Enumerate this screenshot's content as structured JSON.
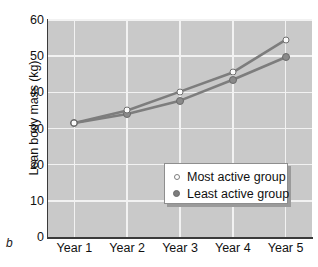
{
  "panel_label": "b",
  "chart_data": {
    "type": "line",
    "title": "",
    "xlabel": "",
    "ylabel": "Lean body mass (kg)",
    "categories": [
      "Year 1",
      "Year 2",
      "Year 3",
      "Year 4",
      "Year 5"
    ],
    "ylim": [
      0,
      60
    ],
    "yticks": [
      0,
      10,
      20,
      30,
      40,
      50,
      60
    ],
    "ytick_labels": [
      "0",
      "10",
      "20",
      "30",
      "40",
      "50",
      "60"
    ],
    "grid": true,
    "legend_position": "center-lower-inside",
    "series": [
      {
        "name": "Most active group",
        "marker": "open-circle",
        "values": [
          31.5,
          35.0,
          40.2,
          45.5,
          54.5
        ]
      },
      {
        "name": "Least active group",
        "marker": "filled-circle",
        "values": [
          31.5,
          34.0,
          37.7,
          43.5,
          49.7
        ]
      }
    ],
    "colors": {
      "plot_background": "#c9c9c9",
      "gridline": "#f2f2f2",
      "axis": "#3a3a3a",
      "line": "#7d7d7d",
      "marker_open_fill": "#fafafa",
      "marker_filled_fill": "#8a8a8a",
      "text": "#111111",
      "legend_background": "#ffffff",
      "legend_shadow": "#9a9a9a"
    }
  }
}
